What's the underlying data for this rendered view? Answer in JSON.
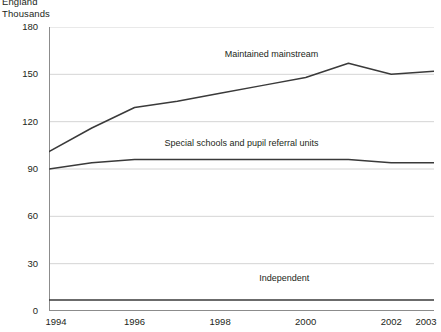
{
  "header": {
    "region": "England",
    "units": "Thousands"
  },
  "chart_data": {
    "type": "line",
    "title": "England",
    "subtitle": "Thousands",
    "xlabel": "",
    "ylabel": "Thousands",
    "x": [
      1994,
      1995,
      1996,
      1997,
      1998,
      1999,
      2000,
      2001,
      2002,
      2003
    ],
    "xlim": [
      1994,
      2003
    ],
    "ylim": [
      0,
      180
    ],
    "yticks": [
      0,
      30,
      60,
      90,
      120,
      150,
      180
    ],
    "xticks": [
      1994,
      1996,
      1998,
      2000,
      2002,
      2003
    ],
    "xtick_labels": [
      "1994",
      "1996",
      "1998",
      "2000",
      "2002",
      "2003"
    ],
    "ytick_labels": [
      "0",
      "30",
      "60",
      "90",
      "120",
      "150",
      "180"
    ],
    "grid": "horizontal",
    "legend": "inline-labels",
    "series": [
      {
        "name": "Maintained mainstream",
        "values": [
          101,
          116,
          129,
          133,
          138,
          143,
          148,
          157,
          150,
          152
        ],
        "color": "#3a3a3a"
      },
      {
        "name": "Special schools and pupil referral units",
        "values": [
          90,
          94,
          96,
          96,
          96,
          96,
          96,
          96,
          94,
          94
        ],
        "color": "#3a3a3a"
      },
      {
        "name": "Independent",
        "values": [
          7,
          7,
          7,
          7,
          7,
          7,
          7,
          7,
          7,
          7
        ],
        "color": "#3a3a3a"
      }
    ],
    "annotations": [
      {
        "text": "Maintained mainstream",
        "x": 1999.2,
        "y": 162
      },
      {
        "text": "Special schools and pupil referral units",
        "x": 1998.5,
        "y": 106
      },
      {
        "text": "Independent",
        "x": 1999.5,
        "y": 20
      }
    ]
  }
}
